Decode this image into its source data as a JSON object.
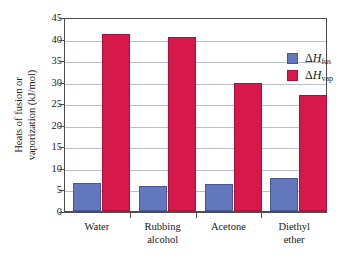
{
  "chart_data": {
    "type": "bar",
    "title": "",
    "xlabel": "",
    "ylabel_line1": "Heats of fusion or",
    "ylabel_line2": "vaporization (kJ/mol)",
    "categories": [
      "Water",
      "Rubbing alcohol",
      "Acetone",
      "Diethyl ether"
    ],
    "category_lines": [
      [
        "Water"
      ],
      [
        "Rubbing",
        "alcohol"
      ],
      [
        "Acetone"
      ],
      [
        "Diethyl",
        "ether"
      ]
    ],
    "series": [
      {
        "name": "ΔHfus",
        "legend_delta": "Δ",
        "legend_h": "H",
        "legend_sub": "fus",
        "color": "#6277bc",
        "values": [
          6.0,
          5.4,
          5.7,
          7.3
        ]
      },
      {
        "name": "ΔHvap",
        "legend_delta": "Δ",
        "legend_h": "H",
        "legend_sub": "vap",
        "color": "#d6194a",
        "values": [
          40.7,
          39.9,
          29.2,
          26.5
        ]
      }
    ],
    "ylim": [
      0,
      45
    ],
    "ytick_values": [
      0,
      5,
      10,
      15,
      20,
      25,
      30,
      35,
      40,
      45
    ],
    "ytick_labels": [
      "0",
      "5",
      "10",
      "15",
      "20",
      "25",
      "30",
      "35",
      "40",
      "45"
    ],
    "grid": true,
    "grid_color": "#b9bfd2",
    "legend_position": "top-right-inside",
    "frame_color": "#4d4d4d",
    "background": "#ffffff"
  }
}
